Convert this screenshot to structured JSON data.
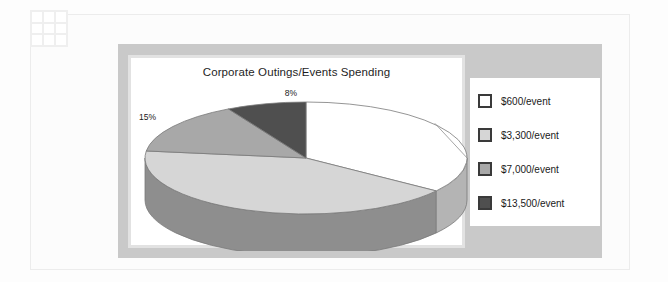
{
  "page": {
    "background_color": "#fdfdfd",
    "border_color": "#ececec"
  },
  "grid_icon": {
    "name": "grid-icon",
    "cells": 9,
    "cell_color": "#ffffff",
    "gap_color": "#efefef"
  },
  "chart_container": {
    "background_color": "#c9c9c9"
  },
  "chart_data": {
    "type": "pie",
    "title": "Corporate Outings/Events Spending",
    "xlabel": "",
    "ylabel": "",
    "three_d": true,
    "legend_position": "right",
    "grid": false,
    "categories": [
      "$600/event",
      "$3,300/event",
      "$7,000/event",
      "$13,500/event"
    ],
    "values": [
      35,
      42,
      15,
      8
    ],
    "data_labels": [
      "35%",
      "42%",
      "15%",
      "8%"
    ],
    "colors": [
      "#ffffff",
      "#d6d6d6",
      "#a8a8a8",
      "#4f4f4f"
    ],
    "side_colors": [
      "#b4b4b4",
      "#8e8e8e",
      "#787878",
      "#3c3c3c"
    ],
    "slices": [
      {
        "label": "$600/event",
        "value": 35,
        "data_label": "35%",
        "color": "#ffffff"
      },
      {
        "label": "$3,300/event",
        "value": 42,
        "data_label": "42%",
        "color": "#d6d6d6"
      },
      {
        "label": "$7,000/event",
        "value": 15,
        "data_label": "15%",
        "color": "#a8a8a8"
      },
      {
        "label": "$13,500/event",
        "value": 8,
        "data_label": "8%",
        "color": "#4f4f4f"
      }
    ]
  },
  "legend": {
    "items": [
      {
        "label": "$600/event",
        "color": "#ffffff"
      },
      {
        "label": "$3,300/event",
        "color": "#d6d6d6"
      },
      {
        "label": "$7,000/event",
        "color": "#a8a8a8"
      },
      {
        "label": "$13,500/event",
        "color": "#4f4f4f"
      }
    ]
  }
}
